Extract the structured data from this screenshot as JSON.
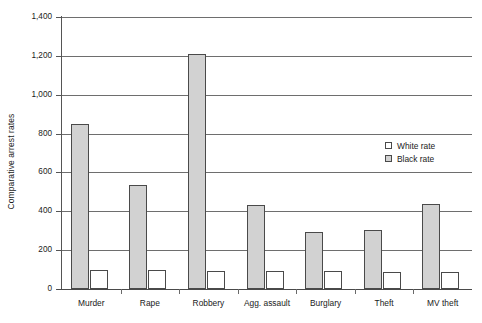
{
  "chart_data": {
    "type": "bar",
    "title": "",
    "xlabel": "",
    "ylabel": "Comparative arrest rates",
    "ylim": [
      0,
      1400
    ],
    "ytick_labels": [
      "0",
      "200",
      "400",
      "600",
      "800",
      "1,000",
      "1,200",
      "1,400"
    ],
    "ytick_values": [
      0,
      200,
      400,
      600,
      800,
      1000,
      1200,
      1400
    ],
    "grid": "horizontal",
    "legend_position": "inside-right",
    "categories": [
      "Murder",
      "Rape",
      "Robbery",
      "Agg. assault",
      "Burglary",
      "Theft",
      "MV theft"
    ],
    "series": [
      {
        "name": "White rate",
        "color": "#ffffff",
        "values": [
          98,
          96,
          95,
          92,
          92,
          90,
          90
        ]
      },
      {
        "name": "Black rate",
        "color": "#d2d2d2",
        "values": [
          848,
          535,
          1210,
          432,
          295,
          302,
          440
        ]
      }
    ]
  },
  "legend": {
    "items": [
      {
        "label": "White rate",
        "swatch": "white-rate"
      },
      {
        "label": "Black rate",
        "swatch": "black-rate"
      }
    ]
  },
  "colors": {
    "black_rate_fill": "#d2d2d2",
    "white_rate_fill": "#ffffff",
    "gridline": "#6e6e6e",
    "axis": "#4a4a4a",
    "text": "#1a1a1a"
  }
}
